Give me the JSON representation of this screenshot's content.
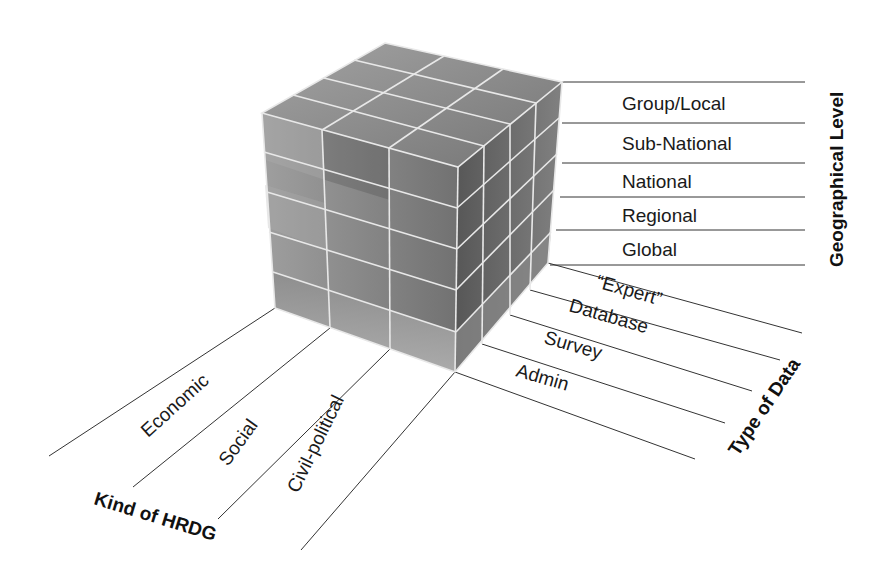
{
  "diagram": {
    "type": "3d-cube-classification",
    "colors": {
      "background": "#ffffff",
      "face_front": "#7a7a7a",
      "face_right": "#5a5a5a",
      "face_top": "#8a8a8a",
      "grid_lines": "#e8e8e8",
      "rule_lines": "#333333",
      "text": "#1a1a1a"
    },
    "axes": {
      "geographical_level": {
        "title": "Geographical Level",
        "levels": [
          "Group/Local",
          "Sub-National",
          "National",
          "Regional",
          "Global"
        ]
      },
      "type_of_data": {
        "title": "Type of Data",
        "types": [
          "“Expert”",
          "Database",
          "Survey",
          "Admin"
        ]
      },
      "kind_of_hrdg": {
        "title": "Kind of HRDG",
        "kinds": [
          "Economic",
          "Social",
          "Civil-political"
        ]
      }
    }
  }
}
